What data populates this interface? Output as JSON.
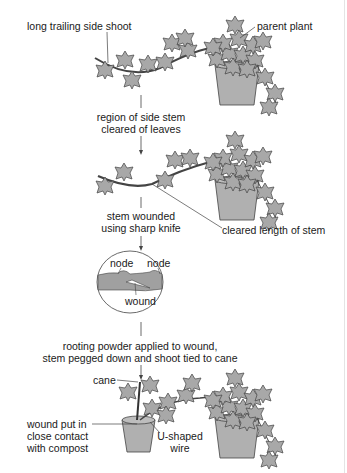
{
  "diagram": {
    "colors": {
      "leaf": "#a8a8a8",
      "pot": "#b0b0b0",
      "stroke": "#444444",
      "text": "#1a1a1a",
      "background": "#ffffff"
    },
    "stage1": {
      "labels": {
        "side_shoot": "long trailing side shoot",
        "parent": "parent plant"
      }
    },
    "step1": {
      "line1": "region of side stem",
      "line2": "cleared of leaves"
    },
    "stage2": {
      "labels": {
        "cleared": "cleared length of stem"
      }
    },
    "step2": {
      "line1": "stem wounded",
      "line2": "using sharp knife"
    },
    "detail": {
      "node_left": "node",
      "node_right": "node",
      "wound": "wound"
    },
    "step3": {
      "line1": "rooting powder applied to wound,",
      "line2": "stem pegged down and shoot tied to cane"
    },
    "stage3": {
      "labels": {
        "cane": "cane",
        "wound1": "wound put in",
        "wound2": "close contact",
        "wound3": "with compost",
        "wire1": "U-shaped",
        "wire2": "wire"
      }
    }
  }
}
